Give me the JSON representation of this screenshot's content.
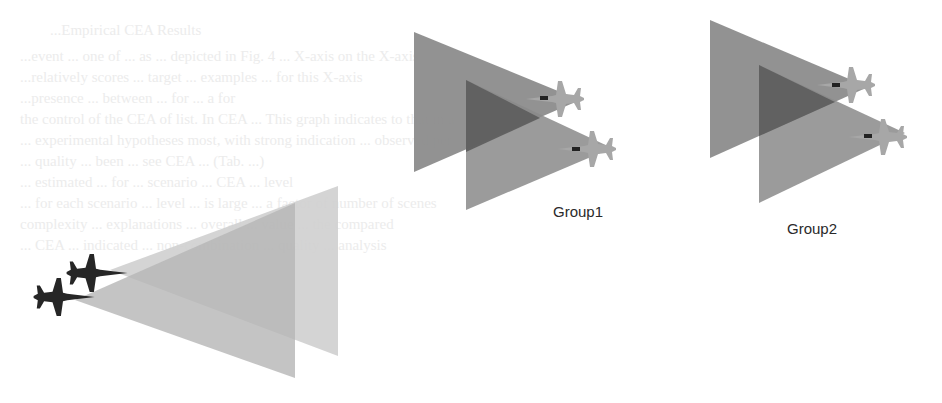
{
  "diagram": {
    "groups": [
      {
        "label": "Group1",
        "label_pos": [
          526,
          198
        ]
      },
      {
        "label": "Group2",
        "label_pos": [
          787,
          220
        ]
      }
    ],
    "colors": {
      "cone_outer": "#8a8a8a",
      "cone_overlap": "#5e5e5e",
      "friendly_cone_front": "#b9b9b9",
      "friendly_cone_back": "#cfcfcf",
      "jet_light": "#a9a9a9",
      "jet_dark": "#2a2a2a"
    },
    "background_text": [
      "...Empirical CEA Results",
      "...event ... one of ... as ... depicted in Fig. 4 ... X-axis on the X-axis",
      "...relatively scores ... target ... examples ... for this X-axis",
      "...presence ... between ... for ... a for",
      "the control of the CEA of list. In CEA ... This graph indicates to that in a",
      "... experimental hypotheses most, with strong indication ... observed per",
      "... quality ... been ... see CEA ... (Tab. ...)",
      "... estimated ... for ... scenario ... CEA ... level",
      "... for each scenario ... level ... is large ... a factor of number of scenes",
      "complexity ... explanations ... overall ... value ... the compared",
      "... CEA ... indicated ... non-combination ... quality ... analysis"
    ]
  }
}
